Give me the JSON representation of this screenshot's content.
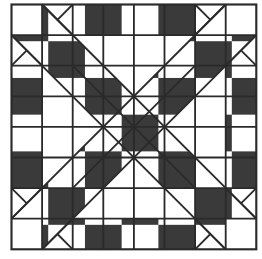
{
  "diagram": {
    "type": "quilt-block",
    "grid": {
      "columns": 8,
      "rows": 8
    },
    "colors": {
      "background": "#ffffff",
      "line": "#2a2a2a",
      "shade_dot": "#3a3a3a"
    },
    "shaded_polygons": [
      [
        [
          1,
          0
        ],
        [
          1.5,
          0.5
        ],
        [
          2,
          0
        ],
        [
          2,
          1
        ],
        [
          1,
          1
        ]
      ],
      [
        [
          2,
          0
        ],
        [
          6,
          0
        ],
        [
          6,
          1
        ],
        [
          2,
          1
        ]
      ],
      [
        [
          6,
          0
        ],
        [
          6.5,
          0.5
        ],
        [
          7,
          0
        ],
        [
          7,
          1
        ],
        [
          6,
          1
        ]
      ],
      [
        [
          1,
          8
        ],
        [
          1.5,
          7.5
        ],
        [
          2,
          8
        ],
        [
          2,
          7
        ],
        [
          1,
          7
        ]
      ],
      [
        [
          2,
          7
        ],
        [
          6,
          7
        ],
        [
          6,
          8
        ],
        [
          2,
          8
        ]
      ],
      [
        [
          6,
          8
        ],
        [
          6.5,
          7.5
        ],
        [
          7,
          8
        ],
        [
          7,
          7
        ],
        [
          6,
          7
        ]
      ],
      [
        [
          0,
          1
        ],
        [
          0.5,
          1.5
        ],
        [
          0,
          2
        ],
        [
          1,
          2
        ],
        [
          1,
          1
        ]
      ],
      [
        [
          0,
          2
        ],
        [
          1,
          2
        ],
        [
          1,
          6
        ],
        [
          0,
          6
        ]
      ],
      [
        [
          0,
          6
        ],
        [
          0.5,
          6.5
        ],
        [
          0,
          7
        ],
        [
          1,
          7
        ],
        [
          1,
          6
        ]
      ],
      [
        [
          8,
          1
        ],
        [
          7.5,
          1.5
        ],
        [
          8,
          2
        ],
        [
          7,
          2
        ],
        [
          7,
          1
        ]
      ],
      [
        [
          7,
          2
        ],
        [
          8,
          2
        ],
        [
          8,
          6
        ],
        [
          7,
          6
        ]
      ],
      [
        [
          8,
          6
        ],
        [
          7.5,
          6.5
        ],
        [
          8,
          7
        ],
        [
          7,
          7
        ],
        [
          7,
          6
        ]
      ],
      [
        [
          1,
          1
        ],
        [
          2,
          1
        ],
        [
          2,
          2
        ],
        [
          1,
          2
        ]
      ],
      [
        [
          6,
          1
        ],
        [
          7,
          1
        ],
        [
          7,
          2
        ],
        [
          6,
          2
        ]
      ],
      [
        [
          1,
          6
        ],
        [
          2,
          6
        ],
        [
          2,
          7
        ],
        [
          1,
          7
        ]
      ],
      [
        [
          6,
          6
        ],
        [
          7,
          6
        ],
        [
          7,
          7
        ],
        [
          6,
          7
        ]
      ],
      [
        [
          2,
          1
        ],
        [
          2,
          2
        ],
        [
          3,
          2
        ]
      ],
      [
        [
          6,
          1
        ],
        [
          6,
          2
        ],
        [
          5,
          2
        ]
      ],
      [
        [
          2,
          7
        ],
        [
          2,
          6
        ],
        [
          3,
          6
        ]
      ],
      [
        [
          6,
          7
        ],
        [
          6,
          6
        ],
        [
          5,
          6
        ]
      ],
      [
        [
          1,
          2
        ],
        [
          2,
          2
        ],
        [
          2,
          3
        ]
      ],
      [
        [
          7,
          2
        ],
        [
          6,
          2
        ],
        [
          6,
          3
        ]
      ],
      [
        [
          1,
          6
        ],
        [
          2,
          6
        ],
        [
          2,
          5
        ]
      ],
      [
        [
          7,
          6
        ],
        [
          6,
          6
        ],
        [
          6,
          5
        ]
      ],
      [
        [
          2,
          2
        ],
        [
          3,
          2
        ],
        [
          3,
          3
        ],
        [
          2,
          3
        ]
      ],
      [
        [
          5,
          2
        ],
        [
          6,
          2
        ],
        [
          6,
          3
        ],
        [
          5,
          3
        ]
      ],
      [
        [
          2,
          5
        ],
        [
          3,
          5
        ],
        [
          3,
          6
        ],
        [
          2,
          6
        ]
      ],
      [
        [
          5,
          5
        ],
        [
          6,
          5
        ],
        [
          6,
          6
        ],
        [
          5,
          6
        ]
      ],
      [
        [
          3,
          2
        ],
        [
          3,
          3
        ],
        [
          4,
          3
        ]
      ],
      [
        [
          5,
          2
        ],
        [
          5,
          3
        ],
        [
          4,
          3
        ]
      ],
      [
        [
          3,
          6
        ],
        [
          3,
          5
        ],
        [
          4,
          5
        ]
      ],
      [
        [
          5,
          6
        ],
        [
          5,
          5
        ],
        [
          4,
          5
        ]
      ],
      [
        [
          2,
          3
        ],
        [
          3,
          3
        ],
        [
          3,
          4
        ]
      ],
      [
        [
          6,
          3
        ],
        [
          5,
          3
        ],
        [
          5,
          4
        ]
      ],
      [
        [
          2,
          5
        ],
        [
          3,
          5
        ],
        [
          3,
          4
        ]
      ],
      [
        [
          6,
          5
        ],
        [
          5,
          5
        ],
        [
          5,
          4
        ]
      ],
      [
        [
          3,
          3
        ],
        [
          5,
          3
        ],
        [
          5,
          5
        ],
        [
          3,
          5
        ]
      ]
    ],
    "diagonal_lines": [
      [
        [
          1,
          0
        ],
        [
          2,
          1
        ]
      ],
      [
        [
          1.5,
          0.5
        ],
        [
          2,
          0
        ]
      ],
      [
        [
          6,
          1
        ],
        [
          7,
          0
        ]
      ],
      [
        [
          6,
          0
        ],
        [
          6.5,
          0.5
        ]
      ],
      [
        [
          1,
          8
        ],
        [
          2,
          7
        ]
      ],
      [
        [
          1.5,
          7.5
        ],
        [
          2,
          8
        ]
      ],
      [
        [
          6,
          7
        ],
        [
          7,
          8
        ]
      ],
      [
        [
          6,
          8
        ],
        [
          6.5,
          7.5
        ]
      ],
      [
        [
          0,
          1
        ],
        [
          1,
          2
        ]
      ],
      [
        [
          0.5,
          1.5
        ],
        [
          0,
          2
        ]
      ],
      [
        [
          0,
          7
        ],
        [
          1,
          6
        ]
      ],
      [
        [
          0,
          6
        ],
        [
          0.5,
          6.5
        ]
      ],
      [
        [
          7,
          2
        ],
        [
          8,
          1
        ]
      ],
      [
        [
          7.5,
          1.5
        ],
        [
          8,
          2
        ]
      ],
      [
        [
          7,
          6
        ],
        [
          8,
          7
        ]
      ],
      [
        [
          7.5,
          6.5
        ],
        [
          8,
          6
        ]
      ],
      [
        [
          1,
          0
        ],
        [
          8,
          7
        ]
      ],
      [
        [
          0,
          1
        ],
        [
          7,
          8
        ]
      ],
      [
        [
          7,
          0
        ],
        [
          0,
          7
        ]
      ],
      [
        [
          8,
          1
        ],
        [
          1,
          8
        ]
      ],
      [
        [
          2,
          2
        ],
        [
          6,
          6
        ]
      ],
      [
        [
          6,
          2
        ],
        [
          2,
          6
        ]
      ]
    ]
  }
}
